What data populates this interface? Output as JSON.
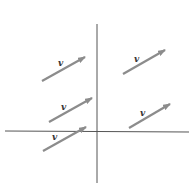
{
  "diagram": {
    "axes": {
      "color": "#555555",
      "x_axis": {
        "x1": 5,
        "y1": 131,
        "x2": 189,
        "y2": 132
      },
      "y_axis": {
        "x1": 97,
        "y1": 24,
        "x2": 97,
        "y2": 183
      }
    },
    "arrow_color": "#8c8c8c",
    "vectors": [
      {
        "label": "v",
        "x1": 42,
        "y1": 81,
        "x2": 85,
        "y2": 57,
        "lx": 58,
        "ly": 66
      },
      {
        "label": "v",
        "x1": 123,
        "y1": 74,
        "x2": 165,
        "y2": 50,
        "lx": 134,
        "ly": 62
      },
      {
        "label": "v",
        "x1": 49,
        "y1": 122,
        "x2": 92,
        "y2": 98,
        "lx": 61,
        "ly": 110
      },
      {
        "label": "v",
        "x1": 129,
        "y1": 128,
        "x2": 170,
        "y2": 104,
        "lx": 140,
        "ly": 116
      },
      {
        "label": "v",
        "x1": 43,
        "y1": 151,
        "x2": 86,
        "y2": 127,
        "lx": 52,
        "ly": 140
      }
    ]
  }
}
